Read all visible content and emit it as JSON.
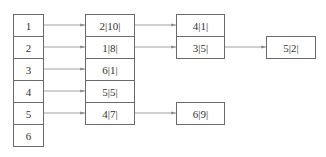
{
  "diagram": {
    "type": "adjacency-list",
    "colors": {
      "line": "#8a8a8a",
      "border": "#6a6a6a",
      "text": "#333333"
    },
    "head_nodes": [
      {
        "label": "1"
      },
      {
        "label": "2"
      },
      {
        "label": "3"
      },
      {
        "label": "4"
      },
      {
        "label": "5"
      },
      {
        "label": "6"
      }
    ],
    "lists": [
      {
        "head": "1",
        "nodes": [
          "2|10|",
          "4|1|"
        ]
      },
      {
        "head": "2",
        "nodes": [
          "1|8|",
          "3|5|",
          "5|2|"
        ]
      },
      {
        "head": "3",
        "nodes": [
          "6|1|"
        ]
      },
      {
        "head": "4",
        "nodes": [
          "5|5|"
        ]
      },
      {
        "head": "5",
        "nodes": [
          "4|7|",
          "6|9|"
        ]
      },
      {
        "head": "6",
        "nodes": []
      }
    ]
  }
}
